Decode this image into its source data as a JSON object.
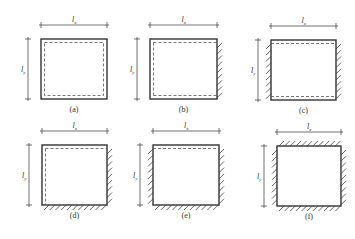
{
  "figure": {
    "panels": [
      {
        "id": "a",
        "caption": "(a)",
        "dim_x": "l",
        "dim_x_sub": "x",
        "dim_y": "l",
        "dim_y_sub": "y",
        "fixed_edges": [],
        "dashed_edges": [
          "top",
          "right",
          "bottom",
          "left"
        ]
      },
      {
        "id": "b",
        "caption": "(b)",
        "dim_x": "l",
        "dim_x_sub": "x",
        "dim_y": "l",
        "dim_y_sub": "y",
        "fixed_edges": [
          "right"
        ],
        "dashed_edges": [
          "top",
          "bottom",
          "left"
        ]
      },
      {
        "id": "c",
        "caption": "(c)",
        "dim_x": "l",
        "dim_x_sub": "x",
        "dim_y": "l",
        "dim_y_sub": "y",
        "fixed_edges": [
          "left",
          "right"
        ],
        "dashed_edges": [
          "top",
          "bottom"
        ]
      },
      {
        "id": "d",
        "caption": "(d)",
        "dim_x": "l",
        "dim_x_sub": "x",
        "dim_y": "l",
        "dim_y_sub": "y",
        "fixed_edges": [
          "right",
          "bottom"
        ],
        "dashed_edges": [
          "top",
          "left"
        ]
      },
      {
        "id": "e",
        "caption": "(e)",
        "dim_x": "l",
        "dim_x_sub": "x",
        "dim_y": "l",
        "dim_y_sub": "y",
        "fixed_edges": [
          "left",
          "right",
          "bottom"
        ],
        "dashed_edges": [
          "top"
        ]
      },
      {
        "id": "f",
        "caption": "(f)",
        "dim_x": "l",
        "dim_x_sub": "x",
        "dim_y": "l",
        "dim_y_sub": "y",
        "fixed_edges": [
          "top",
          "left",
          "right",
          "bottom"
        ],
        "dashed_edges": []
      }
    ],
    "colors": {
      "line": "#333333",
      "dashed": "#555555",
      "hatch": "#444444"
    }
  }
}
